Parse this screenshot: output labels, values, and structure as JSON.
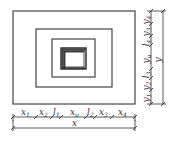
{
  "diagram": {
    "type": "nested-rectangle-plan-dimensioned",
    "colors": {
      "line": "#333333",
      "background": "#ffffff"
    },
    "rectangles": [
      {
        "name": "outer-rect",
        "x": 13,
        "y": 11,
        "w": 122,
        "h": 93
      },
      {
        "name": "second-rect",
        "x": 36,
        "y": 29,
        "w": 76,
        "h": 58
      },
      {
        "name": "third-rect",
        "x": 52,
        "y": 39,
        "w": 43,
        "h": 38
      },
      {
        "name": "core-rect",
        "x": 61,
        "y": 48,
        "w": 25,
        "h": 21
      }
    ],
    "bottom_dimensions": {
      "segments": [
        {
          "label": "x",
          "sub": "1"
        },
        {
          "label": "x",
          "sub": "2"
        },
        {
          "label": "l",
          "sub": "1"
        },
        {
          "label": "x",
          "sub": "u"
        },
        {
          "label": "l",
          "sub": "2"
        },
        {
          "label": "x",
          "sub": "3"
        },
        {
          "label": "x",
          "sub": "4"
        }
      ],
      "total": {
        "label": "x"
      }
    },
    "right_dimensions": {
      "segments_top_to_bottom": [
        {
          "label": "y",
          "sub": "4"
        },
        {
          "label": "y",
          "sub": "3"
        },
        {
          "label": "l",
          "sub": "4"
        },
        {
          "label": "y",
          "sub": "u"
        },
        {
          "label": "l",
          "sub": "3"
        },
        {
          "label": "y",
          "sub": "2"
        },
        {
          "label": "y",
          "sub": "1"
        }
      ],
      "total": {
        "label": "y"
      }
    }
  }
}
